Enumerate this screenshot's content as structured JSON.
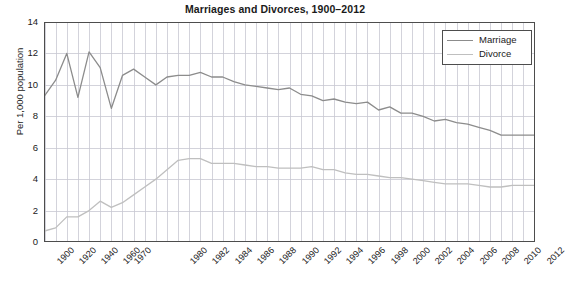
{
  "chart_data": {
    "type": "line",
    "title": "Marriages and Divorces, 1900–2012",
    "xlabel": "",
    "ylabel": "Per 1,000 population",
    "ylim": [
      0,
      14
    ],
    "ytick_labels": [
      "0",
      "2",
      "4",
      "6",
      "8",
      "10",
      "12",
      "14"
    ],
    "ytick_values": [
      0,
      2,
      4,
      6,
      8,
      10,
      12,
      14
    ],
    "grid": true,
    "legend_position": "top-right",
    "x_axis_kind": "categorical-evenly-spaced",
    "categories": [
      "1900",
      "1910",
      "1920",
      "1930",
      "1940",
      "1950",
      "1960",
      "1970",
      "1972",
      "1974",
      "1976",
      "1978",
      "1980",
      "1981",
      "1982",
      "1983",
      "1984",
      "1985",
      "1986",
      "1987",
      "1988",
      "1989",
      "1990",
      "1991",
      "1992",
      "1993",
      "1994",
      "1995",
      "1996",
      "1997",
      "1998",
      "1999",
      "2000",
      "2001",
      "2002",
      "2003",
      "2004",
      "2005",
      "2006",
      "2007",
      "2008",
      "2009",
      "2010",
      "2011",
      "2012"
    ],
    "xtick_labels": [
      "1900",
      "1920",
      "1940",
      "1960",
      "1970",
      "1980",
      "1982",
      "1984",
      "1986",
      "1988",
      "1990",
      "1992",
      "1994",
      "1996",
      "1998",
      "2000",
      "2002",
      "2004",
      "2006",
      "2008",
      "2010",
      "2012"
    ],
    "series": [
      {
        "name": "Marriage",
        "color": "#8c8c8c",
        "values": [
          9.3,
          10.3,
          12.0,
          9.2,
          12.1,
          11.1,
          8.5,
          10.6,
          11.0,
          10.5,
          10.0,
          10.5,
          10.6,
          10.6,
          10.8,
          10.5,
          10.5,
          10.2,
          10.0,
          9.9,
          9.8,
          9.7,
          9.8,
          9.4,
          9.3,
          9.0,
          9.1,
          8.9,
          8.8,
          8.9,
          8.4,
          8.6,
          8.2,
          8.2,
          8.0,
          7.7,
          7.8,
          7.6,
          7.5,
          7.3,
          7.1,
          6.8,
          6.8,
          6.8,
          6.8
        ]
      },
      {
        "name": "Divorce",
        "color": "#bfbfbf",
        "values": [
          0.7,
          0.9,
          1.6,
          1.6,
          2.0,
          2.6,
          2.2,
          2.5,
          3.0,
          3.5,
          4.0,
          4.6,
          5.2,
          5.3,
          5.3,
          5.0,
          5.0,
          5.0,
          4.9,
          4.8,
          4.8,
          4.7,
          4.7,
          4.7,
          4.8,
          4.6,
          4.6,
          4.4,
          4.3,
          4.3,
          4.2,
          4.1,
          4.1,
          4.0,
          3.9,
          3.8,
          3.7,
          3.7,
          3.7,
          3.6,
          3.5,
          3.5,
          3.6,
          3.6,
          3.6
        ]
      }
    ]
  },
  "legend": {
    "items": [
      {
        "label": "Marriage",
        "color": "#8c8c8c"
      },
      {
        "label": "Divorce",
        "color": "#bfbfbf"
      }
    ]
  },
  "axes": {
    "frame_color": "#4d4d4d",
    "grid_color": "#c8c8d2",
    "text_color": "#1a1a1a"
  }
}
